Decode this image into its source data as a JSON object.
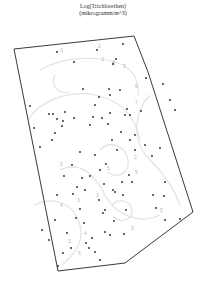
{
  "title": {
    "line1": "Log(Trichlorethen)",
    "line2": "(mikrogramm/m^3)"
  },
  "map": {
    "boundary": [
      [
        14,
        49
      ],
      [
        134,
        36
      ],
      [
        148,
        72
      ],
      [
        193,
        212
      ],
      [
        125,
        263
      ],
      [
        58,
        271
      ]
    ],
    "boundary_color": "#3a3a3a",
    "contour_color": "#e2e2e2",
    "point_color": "#222222",
    "contours": [
      {
        "d": "M40 70 C 60 58, 90 55, 115 62 C 130 66, 140 78, 138 95"
      },
      {
        "d": "M28 120 C 40 100, 70 90, 95 95 C 120 100, 135 115, 140 140"
      },
      {
        "d": "M55 75 C 50 85, 58 95, 70 92"
      },
      {
        "d": "M150 95 C 135 110, 130 140, 150 160 C 165 175, 175 190, 180 205"
      },
      {
        "d": "M60 170 C 80 160, 95 175, 105 195 C 115 215, 140 225, 160 215"
      },
      {
        "d": "M35 205 C 55 195, 75 205, 80 225 C 85 245, 70 258, 62 265"
      },
      {
        "d": "M100 150 C 110 140, 125 145, 128 160 C 130 172, 118 180, 108 172"
      },
      {
        "d": "M112 205 C 118 198, 130 200, 132 210 C 133 220, 120 224, 113 216"
      }
    ],
    "contour_labels": [
      {
        "x": 60,
        "y": 52,
        "text": "3"
      },
      {
        "x": 98,
        "y": 48,
        "text": "2"
      },
      {
        "x": 101,
        "y": 61,
        "text": "3"
      },
      {
        "x": 112,
        "y": 66,
        "text": "4"
      },
      {
        "x": 112,
        "y": 64,
        "text": "4"
      },
      {
        "x": 123,
        "y": 68,
        "text": "5"
      },
      {
        "x": 135,
        "y": 88,
        "text": "6"
      },
      {
        "x": 135,
        "y": 104,
        "text": "7"
      },
      {
        "x": 134,
        "y": 159,
        "text": "2"
      },
      {
        "x": 135,
        "y": 174,
        "text": "5"
      },
      {
        "x": 60,
        "y": 166,
        "text": "5"
      },
      {
        "x": 107,
        "y": 170,
        "text": "5"
      },
      {
        "x": 77,
        "y": 202,
        "text": "3"
      },
      {
        "x": 96,
        "y": 197,
        "text": "3"
      },
      {
        "x": 60,
        "y": 207,
        "text": "4"
      },
      {
        "x": 84,
        "y": 235,
        "text": "4"
      },
      {
        "x": 68,
        "y": 243,
        "text": "3"
      },
      {
        "x": 78,
        "y": 255,
        "text": "5"
      },
      {
        "x": 160,
        "y": 212,
        "text": "5"
      },
      {
        "x": 131,
        "y": 230,
        "text": "5"
      }
    ],
    "points": [
      [
        57,
        52
      ],
      [
        97,
        50
      ],
      [
        74,
        62
      ],
      [
        123,
        44
      ],
      [
        113,
        64
      ],
      [
        116,
        59
      ],
      [
        83,
        89
      ],
      [
        109,
        89
      ],
      [
        30,
        106
      ],
      [
        49,
        114
      ],
      [
        53,
        114
      ],
      [
        65,
        112
      ],
      [
        57,
        119
      ],
      [
        63,
        121
      ],
      [
        62,
        126
      ],
      [
        74,
        118
      ],
      [
        90,
        125
      ],
      [
        93,
        117
      ],
      [
        102,
        118
      ],
      [
        99,
        97
      ],
      [
        95,
        105
      ],
      [
        110,
        95
      ],
      [
        120,
        90
      ],
      [
        110,
        113
      ],
      [
        125,
        115
      ],
      [
        130,
        115
      ],
      [
        108,
        124
      ],
      [
        127,
        109
      ],
      [
        112,
        140
      ],
      [
        117,
        150
      ],
      [
        130,
        140
      ],
      [
        135,
        135
      ],
      [
        121,
        132
      ],
      [
        135,
        150
      ],
      [
        141,
        111
      ],
      [
        145,
        145
      ],
      [
        55,
        133
      ],
      [
        52,
        140
      ],
      [
        34,
        128
      ],
      [
        40,
        147
      ],
      [
        80,
        152
      ],
      [
        72,
        165
      ],
      [
        82,
        178
      ],
      [
        64,
        176
      ],
      [
        90,
        176
      ],
      [
        100,
        170
      ],
      [
        95,
        155
      ],
      [
        106,
        164
      ],
      [
        104,
        184
      ],
      [
        113,
        190
      ],
      [
        115,
        192
      ],
      [
        122,
        182
      ],
      [
        129,
        175
      ],
      [
        132,
        182
      ],
      [
        123,
        195
      ],
      [
        126,
        210
      ],
      [
        105,
        210
      ],
      [
        99,
        200
      ],
      [
        103,
        213
      ],
      [
        105,
        232
      ],
      [
        110,
        235
      ],
      [
        114,
        221
      ],
      [
        124,
        234
      ],
      [
        152,
        156
      ],
      [
        153,
        195
      ],
      [
        156,
        208
      ],
      [
        165,
        220
      ],
      [
        180,
        219
      ],
      [
        77,
        187
      ],
      [
        85,
        190
      ],
      [
        73,
        194
      ],
      [
        80,
        209
      ],
      [
        84,
        223
      ],
      [
        92,
        238
      ],
      [
        86,
        243
      ],
      [
        89,
        248
      ],
      [
        95,
        252
      ],
      [
        76,
        218
      ],
      [
        100,
        260
      ],
      [
        58,
        266
      ],
      [
        146,
        78
      ],
      [
        163,
        84
      ],
      [
        170,
        100
      ],
      [
        175,
        110
      ],
      [
        160,
        148
      ],
      [
        165,
        182
      ],
      [
        164,
        196
      ],
      [
        57,
        195
      ],
      [
        55,
        220
      ],
      [
        42,
        230
      ],
      [
        49,
        240
      ],
      [
        67,
        233
      ],
      [
        71,
        248
      ],
      [
        63,
        253
      ]
    ]
  }
}
